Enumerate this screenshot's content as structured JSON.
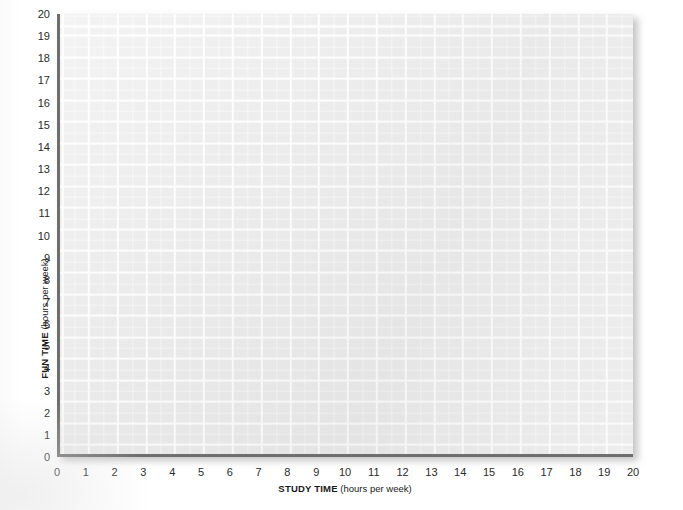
{
  "chart_data": {
    "type": "scatter",
    "title": "",
    "subtitle": "",
    "xlabel_bold": "STUDY TIME",
    "xlabel_rest": " (hours per week)",
    "ylabel_bold": "FUN TIME",
    "ylabel_rest": " (hours per week)",
    "xlim": [
      0,
      20
    ],
    "ylim": [
      0,
      20
    ],
    "x_ticks": [
      0,
      1,
      2,
      3,
      4,
      5,
      6,
      7,
      8,
      9,
      10,
      11,
      12,
      13,
      14,
      15,
      16,
      17,
      18,
      19,
      20
    ],
    "y_ticks": [
      0,
      1,
      2,
      3,
      4,
      5,
      6,
      7,
      8,
      9,
      10,
      11,
      12,
      13,
      14,
      15,
      16,
      17,
      18,
      19,
      20
    ],
    "x_tick_labels": [
      "0",
      "1",
      "2",
      "3",
      "4",
      "5",
      "6",
      "7",
      "8",
      "9",
      "10",
      "11",
      "12",
      "13",
      "14",
      "15",
      "16",
      "17",
      "18",
      "19",
      "20"
    ],
    "y_tick_labels": [
      "0",
      "1",
      "2",
      "3",
      "4",
      "5",
      "6",
      "7",
      "8",
      "9",
      "10",
      "11",
      "12",
      "13",
      "14",
      "15",
      "16",
      "17",
      "18",
      "19",
      "20"
    ],
    "grid": true,
    "grid_color": "#ffffff",
    "panel_color": "#ebebeb",
    "axis_color": "#6e6e6e",
    "legend": [],
    "legend_position": "none",
    "series": [
      {
        "name": "data",
        "x": [],
        "y": []
      }
    ],
    "annotations": [],
    "note": "blank grid worksheet, no data plotted"
  },
  "figure": {
    "background_color": "#ffffff",
    "text_color": "#1a1a1a"
  }
}
